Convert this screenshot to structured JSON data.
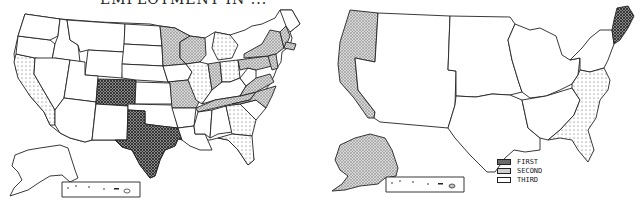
{
  "title": "EMPLOYMENT IN ...",
  "legend": {
    "items": [
      {
        "key": "first",
        "label": "FIRST",
        "pattern": "crosshatch-dark"
      },
      {
        "key": "second",
        "label": "SECOND",
        "pattern": "hatch-light"
      },
      {
        "key": "third",
        "label": "THIRD",
        "pattern": "dots"
      }
    ]
  },
  "maps": [
    {
      "name": "by-state",
      "first": [
        "Colorado",
        "Texas"
      ],
      "second": [
        "Minnesota",
        "Wisconsin",
        "Missouri",
        "Indiana",
        "Tennessee",
        "Virginia",
        "North Carolina",
        "Pennsylvania",
        "New York",
        "Massachusetts",
        "Connecticut",
        "New Jersey",
        "Maryland",
        "Vermont",
        "New Hampshire"
      ],
      "third": [
        "California",
        "Illinois",
        "Michigan",
        "Ohio",
        "Georgia",
        "Florida"
      ]
    },
    {
      "name": "by-region",
      "first": [
        "New England"
      ],
      "second": [
        "Pacific (incl. Alaska)"
      ],
      "third": [
        "South Atlantic"
      ]
    }
  ],
  "colors": {
    "outline": "#222222",
    "first_fill": "#555555",
    "second_fill": "#bdbdbd",
    "third_fill": "#eeeeee"
  }
}
